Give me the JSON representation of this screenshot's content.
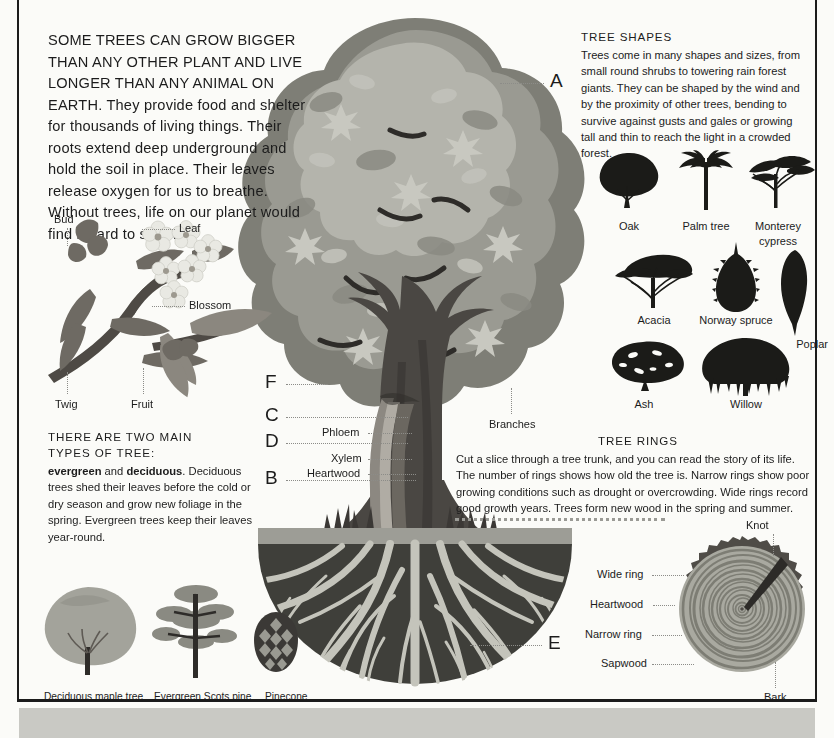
{
  "intro": {
    "caps_text": "SOME TREES CAN GROW BIGGER THAN ANY OTHER PLANT AND LIVE LONGER THAN ANY ANIMAL ON EARTH.",
    "rest_text": " They provide food and shelter for thousands of living things. Their roots extend deep underground and hold the soil in place. Their leaves release oxygen for us to breathe. Without trees, life on our planet would find it hard to survive."
  },
  "twig_diagram": {
    "labels": {
      "bud": "Bud",
      "leaf": "Leaf",
      "blossom": "Blossom",
      "twig": "Twig",
      "fruit": "Fruit"
    }
  },
  "types_block": {
    "title_line1": "THERE ARE TWO MAIN",
    "title_line2": "TYPES OF TREE:",
    "bold1": "evergreen",
    "mid": " and ",
    "bold2": "deciduous",
    "rest": ". Deciduous trees shed their leaves before the cold or dry season and grow new foliage in the spring. Evergreen trees keep their leaves year-round."
  },
  "bottom_left_captions": {
    "deciduous": "Deciduous maple tree",
    "evergreen": "Evergreen Scots pine",
    "pinecone": "Pinecone"
  },
  "tree_callouts": {
    "a": "A",
    "b": "B",
    "c": "C",
    "d": "D",
    "e": "E",
    "f": "F",
    "phloem": "Phloem",
    "xylem": "Xylem",
    "heartwood": "Heartwood",
    "branches": "Branches"
  },
  "tree_shapes": {
    "title": "TREE SHAPES",
    "paragraph": "Trees come in many shapes and sizes, from small round shrubs to towering rain forest giants. They can be shaped by the wind and by the proximity of other trees, bending to survive against gusts and gales or growing tall and thin to reach the light in a crowded forest.",
    "items": [
      {
        "label": "Oak"
      },
      {
        "label": "Palm tree"
      },
      {
        "label": "Monterey",
        "label2": "cypress"
      },
      {
        "label": "Acacia"
      },
      {
        "label": "Norway spruce"
      },
      {
        "label": "Poplar"
      },
      {
        "label": "Ash"
      },
      {
        "label": "Willow"
      }
    ]
  },
  "tree_rings": {
    "title": "TREE RINGS",
    "paragraph": "Cut a slice through a tree trunk, and you can read the story of its life. The number of rings shows how old the tree is. Narrow rings show poor growing conditions such as drought or overcrowding. Wide rings record good growth years. Trees form new wood in the spring and summer.",
    "labels": {
      "knot": "Knot",
      "wide_ring": "Wide ring",
      "heartwood": "Heartwood",
      "narrow_ring": "Narrow ring",
      "sapwood": "Sapwood",
      "bark": "Bark"
    }
  },
  "colors": {
    "ink": "#1c1c1c",
    "paper": "#fbfbf8",
    "canopy_light": "#b4b4ac",
    "canopy_mid": "#9a9a92",
    "canopy_dark": "#7e7e76",
    "canopy_darkest": "#4a4a44",
    "trunk": "#55514c",
    "trunk_dark": "#3b3835",
    "soil": "#3f3f3a",
    "root": "#c4c4bb",
    "ground": "#9d9d96",
    "silhouette": "#1b1b18",
    "ring_outer": "#5a5a53",
    "ring_mid": "#9b9b93",
    "ring_inner": "#b8b8b0",
    "band": "#c9c9c4"
  }
}
